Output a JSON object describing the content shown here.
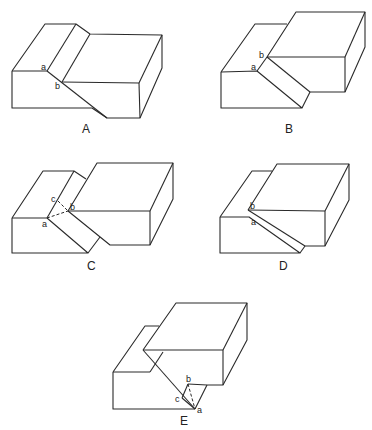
{
  "figures": [
    {
      "caption": "A",
      "points": [
        "a",
        "b"
      ]
    },
    {
      "caption": "B",
      "points": [
        "a",
        "b"
      ]
    },
    {
      "caption": "C",
      "points": [
        "a",
        "b",
        "c"
      ]
    },
    {
      "caption": "D",
      "points": [
        "a",
        "b"
      ]
    },
    {
      "caption": "E",
      "points": [
        "a",
        "b",
        "c"
      ]
    }
  ],
  "colors": {
    "line": "#2a2a2a",
    "background": "#ffffff"
  }
}
